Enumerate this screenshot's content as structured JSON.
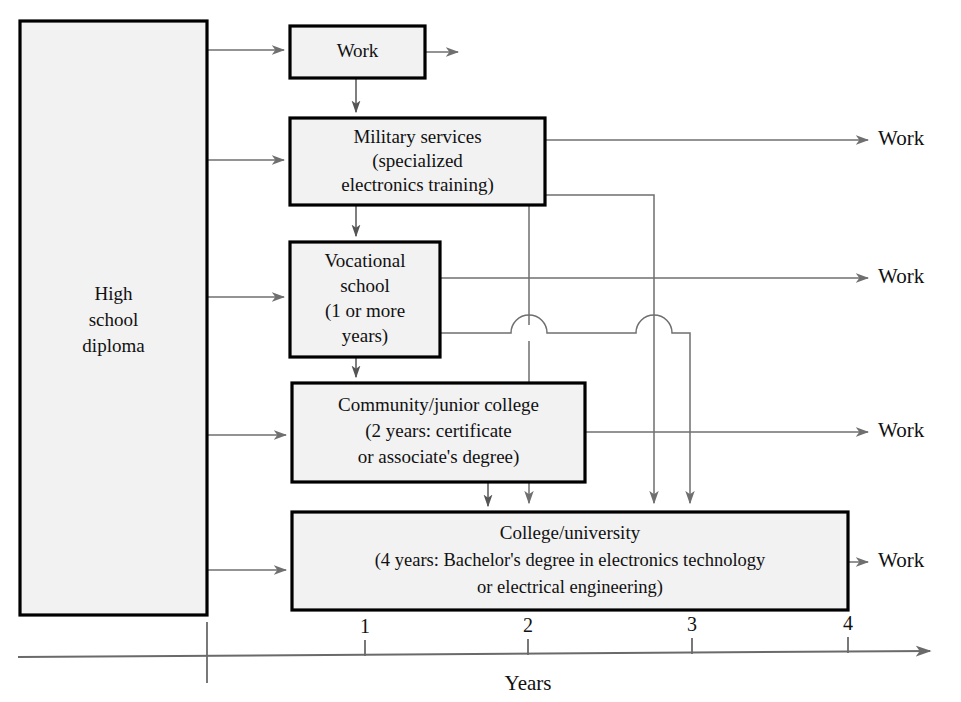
{
  "diagram": {
    "type": "flowchart-timeline",
    "background_color": "#ffffff",
    "box_fill_color": "#f2f2f2",
    "box_border_color": "#000000",
    "connector_color": "#6f6f6f"
  },
  "nodes": {
    "high_school": {
      "lines": [
        "High",
        "school",
        "diploma"
      ],
      "x": 20,
      "y": 21,
      "w": 187,
      "h": 594
    },
    "work": {
      "lines": [
        "Work"
      ],
      "x": 290,
      "y": 26,
      "w": 135,
      "h": 52
    },
    "military": {
      "lines": [
        "Military services",
        "(specialized",
        "electronics training)"
      ],
      "x": 290,
      "y": 118,
      "w": 255,
      "h": 87
    },
    "vocational": {
      "lines": [
        "Vocational",
        "school",
        "(1 or more",
        "years)"
      ],
      "x": 290,
      "y": 242,
      "w": 150,
      "h": 115
    },
    "community": {
      "lines": [
        "Community/junior college",
        "(2 years: certificate",
        "or associate's degree)"
      ],
      "x": 292,
      "y": 383,
      "w": 293,
      "h": 99
    },
    "college": {
      "lines": [
        "College/university",
        "(4 years: Bachelor's degree in electronics technology",
        "or electrical engineering)"
      ],
      "x": 292,
      "y": 512,
      "w": 556,
      "h": 98
    }
  },
  "work_outcomes": [
    {
      "label": "Work",
      "x": 878,
      "y": 140
    },
    {
      "label": "Work",
      "x": 878,
      "y": 270
    },
    {
      "label": "Work",
      "x": 878,
      "y": 430
    },
    {
      "label": "Work",
      "x": 878,
      "y": 562
    }
  ],
  "axis": {
    "label": "Years",
    "label_x": 528,
    "label_y": 688,
    "y": 655,
    "x_start": 18,
    "x_end": 940,
    "ticks": [
      {
        "value": "",
        "x": 207
      },
      {
        "value": "1",
        "x": 365
      },
      {
        "value": "2",
        "x": 528
      },
      {
        "value": "3",
        "x": 692
      },
      {
        "value": "4",
        "x": 848
      }
    ]
  }
}
